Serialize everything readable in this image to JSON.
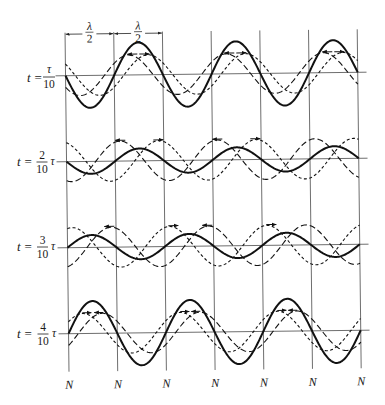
{
  "figure": {
    "dimension_labels": [
      {
        "numerator": "λ",
        "denominator": "2"
      },
      {
        "numerator": "λ",
        "denominator": "2"
      }
    ],
    "node_labels": [
      "N",
      "N",
      "N",
      "N",
      "N",
      "N",
      "N"
    ],
    "rows": [
      {
        "label": {
          "variable": "t",
          "equals": "=",
          "numerator": "τ",
          "denominator": "10",
          "suffix": ""
        },
        "time_fraction": 0.1,
        "arrows": [
          {
            "from": 139,
            "to": 129,
            "dir": "left"
          },
          {
            "from": 141,
            "to": 151,
            "dir": "right"
          },
          {
            "from": 236,
            "to": 226,
            "dir": "left"
          },
          {
            "from": 238,
            "to": 248,
            "dir": "right"
          },
          {
            "from": 334,
            "to": 324,
            "dir": "left"
          },
          {
            "from": 336,
            "to": 346,
            "dir": "right"
          }
        ]
      },
      {
        "label": {
          "variable": "t",
          "equals": "=",
          "numerator": "2",
          "denominator": "10",
          "suffix": "τ"
        },
        "time_fraction": 0.2,
        "arrows": [
          {
            "from": 126,
            "to": 116,
            "dir": "left"
          },
          {
            "from": 154,
            "to": 164,
            "dir": "right"
          },
          {
            "from": 223,
            "to": 213,
            "dir": "left"
          },
          {
            "from": 251,
            "to": 261,
            "dir": "right"
          }
        ]
      },
      {
        "label": {
          "variable": "t",
          "equals": "=",
          "numerator": "3",
          "denominator": "10",
          "suffix": "τ"
        },
        "time_fraction": 0.3,
        "arrows": [
          {
            "from": 114,
            "to": 104,
            "dir": "left"
          },
          {
            "from": 168,
            "to": 178,
            "dir": "right"
          },
          {
            "from": 212,
            "to": 202,
            "dir": "left"
          },
          {
            "from": 266,
            "to": 276,
            "dir": "right"
          }
        ]
      },
      {
        "label": {
          "variable": "t",
          "equals": "=",
          "numerator": "4",
          "denominator": "10",
          "suffix": "τ"
        },
        "time_fraction": 0.4,
        "arrows": [
          {
            "from": 81,
            "to": 90,
            "dir": "right"
          },
          {
            "from": 102,
            "to": 93,
            "dir": "left"
          },
          {
            "from": 179,
            "to": 188,
            "dir": "right"
          },
          {
            "from": 199,
            "to": 190,
            "dir": "left"
          },
          {
            "from": 276,
            "to": 285,
            "dir": "right"
          },
          {
            "from": 296,
            "to": 287,
            "dir": "left"
          }
        ]
      }
    ],
    "geometry": {
      "node_x0": 67,
      "node_spacing": 48.7,
      "node_count": 7,
      "traveling_amplitude": 20,
      "baselines_y": [
        74,
        160,
        246,
        332
      ],
      "baseline_x": [
        57,
        368
      ],
      "vertical_y": [
        31,
        370
      ],
      "dimension_y": 32.5,
      "skew_deg": -0.67,
      "skew_center": [
        213,
        200
      ]
    },
    "colors": {
      "wave": "#111111",
      "grid": "#4a4a4a",
      "background": "#ffffff"
    }
  }
}
